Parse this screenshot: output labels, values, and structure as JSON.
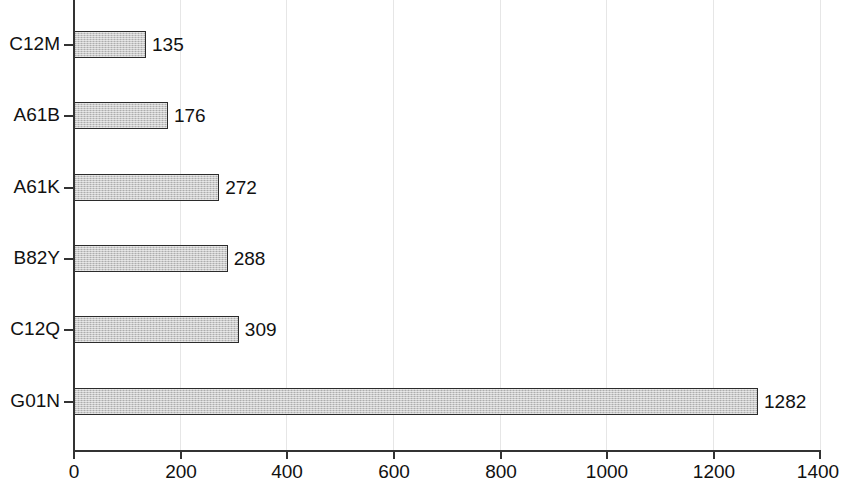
{
  "chart_data": {
    "type": "bar",
    "orientation": "horizontal",
    "title": "",
    "subtitle": "",
    "xlabel": "",
    "ylabel": "",
    "categories": [
      "C12M",
      "A61B",
      "A61K",
      "B82Y",
      "C12Q",
      "G01N"
    ],
    "values": [
      135,
      176,
      272,
      288,
      309,
      1282
    ],
    "data_labels": [
      "135",
      "176",
      "272",
      "288",
      "309",
      "1282"
    ],
    "xlim": [
      0,
      1400
    ],
    "xticks": [
      0,
      200,
      400,
      600,
      800,
      1000,
      1200,
      1400
    ],
    "xtick_labels": [
      "0",
      "200",
      "400",
      "600",
      "800",
      "1000",
      "1200",
      "1400"
    ],
    "grid": true,
    "grid_axis": "x",
    "legend": false,
    "legend_position": "none",
    "annotations": [],
    "colors": {
      "bar_fill": "#c9c9c9",
      "bar_edge": "#2b2b2b",
      "axis": "#333333",
      "gridline": "#e6e6e6",
      "text": "#111111",
      "background": "#ffffff"
    }
  }
}
